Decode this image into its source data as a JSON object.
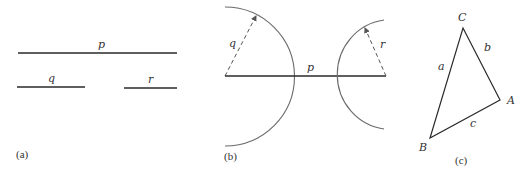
{
  "panels": {
    "a": {
      "caption": "(a)",
      "segments": [
        {
          "name": "p",
          "label": "p",
          "x1": 18,
          "x2": 177,
          "y": 53
        },
        {
          "name": "q",
          "label": "q",
          "x1": 17,
          "x2": 85,
          "y": 87
        },
        {
          "name": "r",
          "label": "r",
          "x1": 124,
          "x2": 177,
          "y": 88
        }
      ]
    },
    "b": {
      "caption": "(b)",
      "p_label": "p",
      "q_label": "q",
      "r_label": "r",
      "left_circle": {
        "cx": 225,
        "cy": 76,
        "radius": 68
      },
      "right_circle": {
        "cx": 386,
        "cy": 76,
        "radius": 54
      }
    },
    "c": {
      "caption": "(c)",
      "vertices": {
        "A": "A",
        "B": "B",
        "C": "C"
      },
      "sides": {
        "a": "a",
        "b": "b",
        "c": "c"
      }
    }
  },
  "colors": {
    "line": "#2a2a2a",
    "arc": "#6a6a6a",
    "text": "#333333"
  }
}
